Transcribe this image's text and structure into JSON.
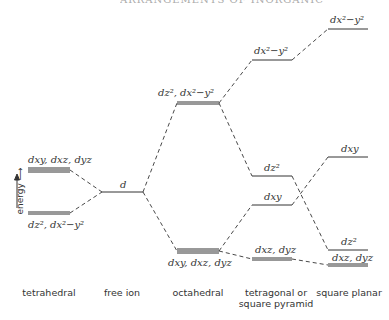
{
  "header": {
    "text": "ARRANGEMENTS OF INORGANIC REACTIONS"
  },
  "axis": {
    "label": "energy ⟶"
  },
  "columns": [
    {
      "id": "tetrahedral",
      "caption": "tetrahedral"
    },
    {
      "id": "free_ion",
      "caption": "free ion"
    },
    {
      "id": "octahedral",
      "caption": "octahedral"
    },
    {
      "id": "tetragonal",
      "caption": "tetragonal or square pyramid"
    },
    {
      "id": "square_planar",
      "caption": "square planar"
    }
  ],
  "levels": {
    "tetrahedral_upper": "dxy, dxz, dyz",
    "tetrahedral_lower": "dz², dx²−y²",
    "free_ion": "d",
    "octahedral_upper": "dz², dx²−y²",
    "octahedral_lower": "dxy, dxz, dyz",
    "tetragonal_1": "dx²−y²",
    "tetragonal_2": "dz²",
    "tetragonal_3": "dxy",
    "tetragonal_4": "dxz, dyz",
    "square_planar_1": "dx²−y²",
    "square_planar_2": "dxy",
    "square_planar_3": "dz²",
    "square_planar_4": "dxz, dyz"
  },
  "captions": {
    "tetrahedral": "tetrahedral",
    "free_ion": "free ion",
    "octahedral": "octahedral",
    "tetragonal_line1": "tetragonal or",
    "tetragonal_line2": "square pyramid",
    "square_planar": "square planar"
  }
}
